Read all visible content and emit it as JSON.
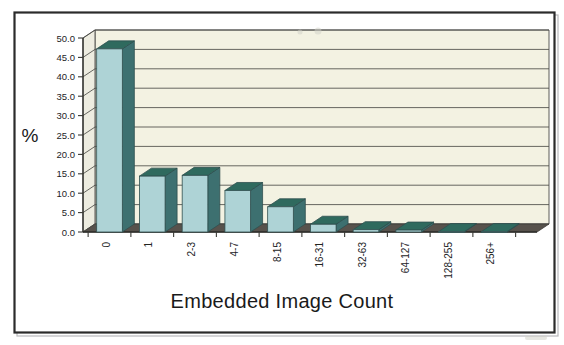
{
  "figure": {
    "kind": "3d-bar-chart-scan",
    "background_color": "#ffffff",
    "frame_color": "#2b2b2b"
  },
  "colors": {
    "bar_front": "#aed3d6",
    "bar_side": "#3d7070",
    "bar_top": "#2f6a5e",
    "plot_back": "#f3f2e2",
    "plot_left": "#edece0",
    "floor": "#57524c",
    "gridline": "#4d4d48",
    "text": "#1a1a1a"
  },
  "chart_data": {
    "type": "bar",
    "title": "",
    "xlabel": "Embedded Image Count",
    "ylabel": "%",
    "categories": [
      "0",
      "1",
      "2-3",
      "4-7",
      "8-15",
      "16-31",
      "32-63",
      "64-127",
      "128-255",
      "256+"
    ],
    "values": [
      47.2,
      14.4,
      14.6,
      10.7,
      6.5,
      2.0,
      0.6,
      0.5,
      0.1,
      0.1
    ],
    "ylim": [
      0,
      50
    ],
    "ytick_values": [
      0,
      5,
      10,
      15,
      20,
      25,
      30,
      35,
      40,
      45,
      50
    ],
    "ytick_labels": [
      "0.0",
      "5.0",
      "10.0",
      "15.0",
      "20.0",
      "25.0",
      "30.0",
      "35.0",
      "40.0",
      "45.0",
      "50.0"
    ],
    "grid": true,
    "legend": false,
    "legend_position": "none",
    "series": [
      {
        "name": "Embedded Image Count distribution",
        "values": [
          47.2,
          14.4,
          14.6,
          10.7,
          6.5,
          2.0,
          0.6,
          0.5,
          0.1,
          0.1
        ]
      }
    ]
  },
  "labels": {
    "y_axis_title": "%",
    "x_axis_title": "Embedded Image Count"
  }
}
